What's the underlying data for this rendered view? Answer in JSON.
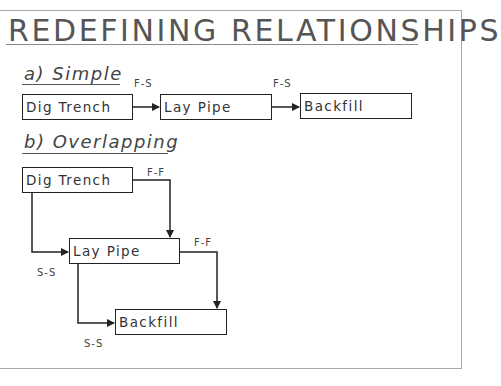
{
  "title": "REDEFINING RELATIONSHIPS",
  "sections": {
    "simple": {
      "heading": "a) Simple",
      "tasks": [
        "Dig Trench",
        "Lay Pipe",
        "Backfill"
      ],
      "links": [
        {
          "from": "Dig Trench",
          "to": "Lay Pipe",
          "type": "F-S"
        },
        {
          "from": "Lay Pipe",
          "to": "Backfill",
          "type": "F-S"
        }
      ]
    },
    "overlapping": {
      "heading": "b) Overlapping",
      "tasks": [
        "Dig Trench",
        "Lay Pipe",
        "Backfill"
      ],
      "links": [
        {
          "from": "Dig Trench",
          "to": "Lay Pipe",
          "type": "F-F"
        },
        {
          "from": "Dig Trench",
          "to": "Lay Pipe",
          "type": "S-S"
        },
        {
          "from": "Lay Pipe",
          "to": "Backfill",
          "type": "F-F"
        },
        {
          "from": "Lay Pipe",
          "to": "Backfill",
          "type": "S-S"
        }
      ]
    }
  },
  "colors": {
    "line": "#222222",
    "frame": "#a9a9a9",
    "title": "#555555"
  }
}
